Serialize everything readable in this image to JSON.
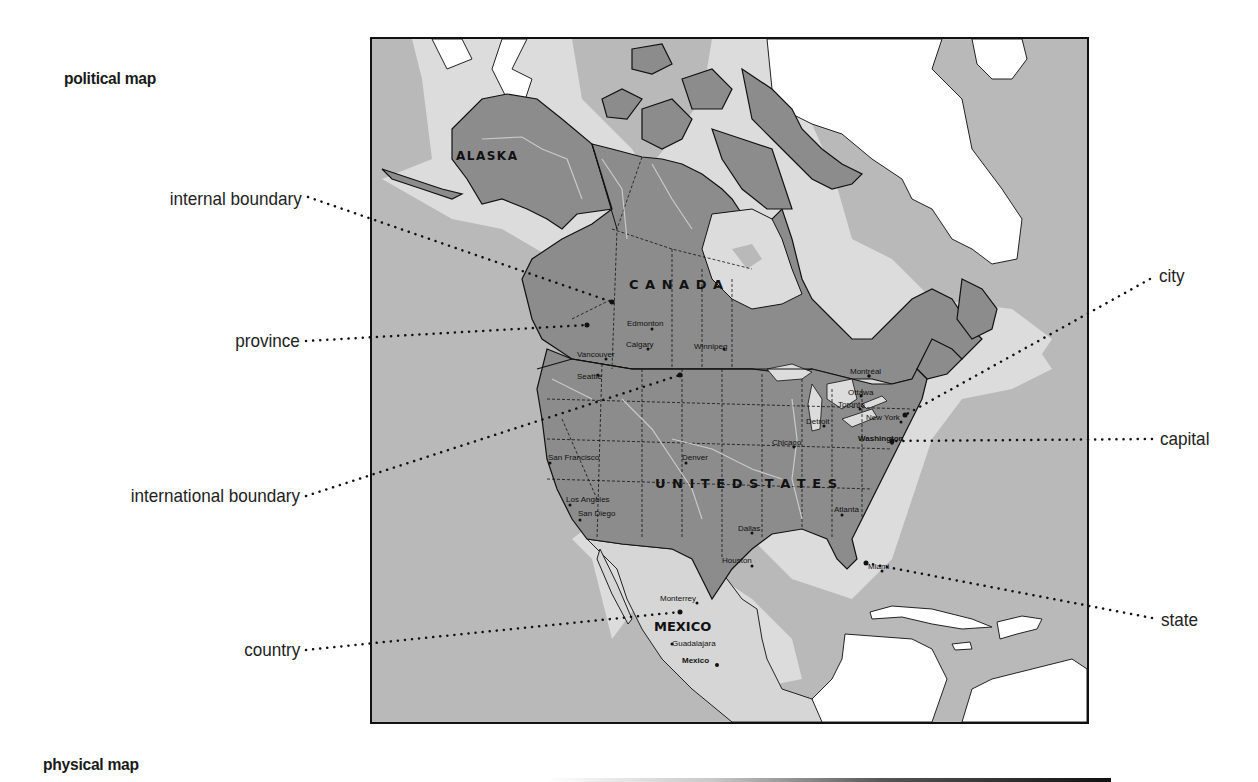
{
  "sections": {
    "political_title": "political map",
    "physical_title": "physical map"
  },
  "callouts_left": [
    {
      "id": "internal-boundary",
      "label": "internal boundary"
    },
    {
      "id": "province",
      "label": "province"
    },
    {
      "id": "international-boundary",
      "label": "international boundary"
    },
    {
      "id": "country",
      "label": "country"
    }
  ],
  "callouts_right": [
    {
      "id": "city",
      "label": "city"
    },
    {
      "id": "capital",
      "label": "capital"
    },
    {
      "id": "state",
      "label": "state"
    }
  ],
  "map": {
    "countries": {
      "alaska": "ALASKA",
      "canada": "C A N A D A",
      "united_states": "U N I T E D   S T A T E S",
      "mexico": "MEXICO"
    },
    "cities": {
      "edmonton": "Edmonton",
      "calgary": "Calgary",
      "vancouver": "Vancouver",
      "seattle": "Seattle",
      "winnipeg": "Winnipeg",
      "montreal": "Montréal",
      "ottawa": "Ottawa",
      "toronto": "Toronto",
      "detroit": "Detroit",
      "chicago": "Chicago",
      "new_york": "New York",
      "washington": "Washington",
      "san_francisco": "San Francisco",
      "denver": "Denver",
      "los_angeles": "Los Angeles",
      "san_diego": "San Diego",
      "dallas": "Dallas",
      "houston": "Houston",
      "atlanta": "Atlanta",
      "miami": "Miami",
      "monterrey": "Monterrey",
      "guadalajara": "Guadalajara",
      "mexico_city": "Mexico"
    },
    "colors": {
      "ocean": "#b9b9b9",
      "shelf": "#dcdcdc",
      "land_featured": "#8c8c8c",
      "land_other": "#ffffff",
      "mexico": "#d6d6d6",
      "border": "#111111",
      "river": "#c9c9c9"
    }
  }
}
